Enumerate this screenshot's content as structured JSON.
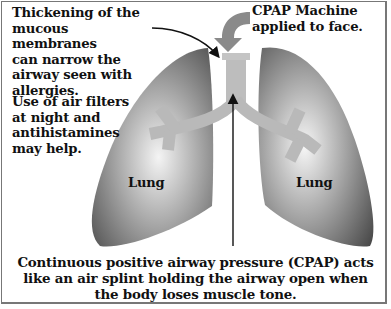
{
  "diagram": {
    "annotations": {
      "mucous_note": "Thickening of the\nmucous membranes\ncan narrow the\nairway seen with\nallergies.",
      "filter_note": "Use of air filters\nat night and\nantihistamines\nmay help.",
      "cpap_label": "CPAP Machine\napplied to face.",
      "left_lung": "Lung",
      "right_lung": "Lung",
      "caption": "Continuous positive airway pressure (CPAP) acts\nlike an air splint holding the airway open when\nthe body loses muscle tone."
    },
    "colors": {
      "lung_dark": "#555555",
      "lung_light": "#f2f2f2",
      "airway": "#b9b9b9",
      "cpap_arrow": "#8a8a8a",
      "border": "#777777"
    }
  }
}
